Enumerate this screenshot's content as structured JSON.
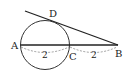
{
  "diagram": {
    "type": "geometry",
    "circle": {
      "cx": 45,
      "cy": 45,
      "r": 24.5
    },
    "points": {
      "A": {
        "label": "A",
        "x": 20.5,
        "y": 45
      },
      "C": {
        "label": "C",
        "x": 69.5,
        "y": 45
      },
      "B": {
        "label": "B",
        "x": 118,
        "y": 45
      },
      "D": {
        "label": "D",
        "x": 50,
        "y": 21
      }
    },
    "segments": [
      {
        "from": "A",
        "to": "B"
      },
      {
        "from": "tangent_start",
        "to": "B"
      }
    ],
    "measures": [
      {
        "between": [
          "A",
          "C"
        ],
        "value": "2"
      },
      {
        "between": [
          "C",
          "B"
        ],
        "value": "2"
      }
    ],
    "colors": {
      "stroke": "#222222",
      "dash": "#666666"
    }
  }
}
